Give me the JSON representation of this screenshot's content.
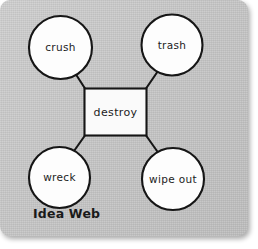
{
  "card": {
    "background_color": "#c9c9c9",
    "caption": "Idea Web"
  },
  "diagram": {
    "type": "idea-web",
    "center": {
      "label": "destroy",
      "shape": "rectangle",
      "fill_color": "#fafafa",
      "stroke_color": "#161616"
    },
    "nodes": [
      {
        "label": "crush",
        "position": "top-left",
        "shape": "circle",
        "fill_color": "#fdfdfd",
        "stroke_color": "#161616"
      },
      {
        "label": "trash",
        "position": "top-right",
        "shape": "circle",
        "fill_color": "#fdfdfd",
        "stroke_color": "#161616"
      },
      {
        "label": "wreck",
        "position": "bottom-left",
        "shape": "circle",
        "fill_color": "#fdfdfd",
        "stroke_color": "#161616"
      },
      {
        "label": "wipe out",
        "position": "bottom-right",
        "shape": "circle",
        "fill_color": "#fdfdfd",
        "stroke_color": "#161616"
      }
    ],
    "connectors": [
      {
        "from": "destroy",
        "to": "crush"
      },
      {
        "from": "destroy",
        "to": "trash"
      },
      {
        "from": "destroy",
        "to": "wreck"
      },
      {
        "from": "destroy",
        "to": "wipe out"
      }
    ]
  }
}
